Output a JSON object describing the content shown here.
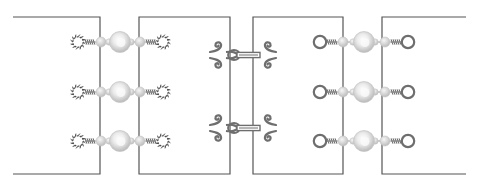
{
  "diagram": {
    "colors": {
      "background": "#ffffff",
      "panel_border": "#555555",
      "metal": "#6e6e6e",
      "bead_light": "#f2f2f2",
      "bead_mid": "#d8d8d8",
      "bead_shadow": "#b5b5b5"
    },
    "panels": [
      {
        "id": "panel-1",
        "left": 13,
        "right": 100,
        "open_side": "left"
      },
      {
        "id": "panel-2",
        "left": 139,
        "right": 230,
        "open_side": "none"
      },
      {
        "id": "panel-3",
        "left": 253,
        "right": 343,
        "open_side": "none"
      },
      {
        "id": "panel-4",
        "left": 382,
        "right": 466,
        "open_side": "right"
      }
    ],
    "panel_top": 17,
    "panel_bottom": 174,
    "joins": [
      {
        "between": [
          "panel-1",
          "panel-2"
        ],
        "type": "beaded-connector",
        "end_style": "sun-loop",
        "rows": [
          42,
          92,
          141
        ],
        "left_loop_x": 78,
        "right_loop_x": 163,
        "center_x": 120
      },
      {
        "between": [
          "panel-2",
          "panel-3"
        ],
        "type": "hook-and-eye",
        "rows": [
          55,
          128
        ],
        "left_x": 218,
        "right_x": 268
      },
      {
        "between": [
          "panel-3",
          "panel-4"
        ],
        "type": "beaded-connector",
        "end_style": "ring-loop",
        "rows": [
          42,
          92,
          141
        ],
        "left_loop_x": 320,
        "right_loop_x": 408,
        "center_x": 364
      }
    ]
  }
}
